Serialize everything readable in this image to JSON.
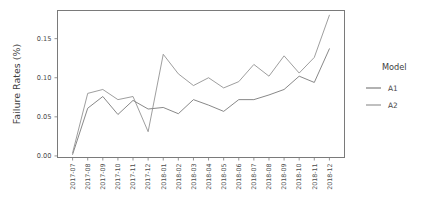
{
  "chart_data": {
    "type": "line",
    "title": "",
    "xlabel": "",
    "ylabel": "Failure Rates (%)",
    "categories": [
      "2017-07",
      "2017-08",
      "2017-09",
      "2017-10",
      "2017-11",
      "2017-12",
      "2018-01",
      "2018-02",
      "2018-03",
      "2018-04",
      "2018-05",
      "2018-06",
      "2018-07",
      "2018-08",
      "2018-09",
      "2018-10",
      "2018-11",
      "2018-12"
    ],
    "series": [
      {
        "name": "A1",
        "values": [
          0.002,
          0.061,
          0.076,
          0.053,
          0.071,
          0.06,
          0.062,
          0.054,
          0.072,
          0.065,
          0.057,
          0.072,
          0.072,
          0.078,
          0.085,
          0.102,
          0.094,
          0.137
        ],
        "color": "#737373"
      },
      {
        "name": "A2",
        "values": [
          0.004,
          0.08,
          0.085,
          0.072,
          0.076,
          0.031,
          0.13,
          0.105,
          0.09,
          0.1,
          0.087,
          0.095,
          0.117,
          0.102,
          0.128,
          0.106,
          0.126,
          0.18
        ],
        "color": "#8c8c8c"
      }
    ],
    "yticks": [
      0.0,
      0.05,
      0.1,
      0.15
    ],
    "ytick_labels": [
      "0.00",
      "0.05",
      "0.10",
      "0.15"
    ],
    "ylim": [
      -0.002,
      0.186
    ],
    "grid": false,
    "legend_position": "right"
  },
  "legend": {
    "title": "Model",
    "entries": [
      {
        "label": "A1",
        "color": "#737373"
      },
      {
        "label": "A2",
        "color": "#8c8c8c"
      }
    ]
  },
  "axes": {
    "y_title": "Failure Rates (%)"
  }
}
